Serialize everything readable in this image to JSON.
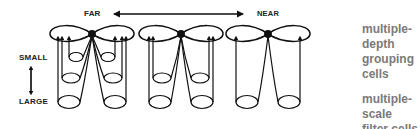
{
  "axis": {
    "depth": {
      "far_label": "FAR",
      "near_label": "NEAR"
    },
    "scale": {
      "small_label": "SMALL",
      "large_label": "LARGE"
    }
  },
  "labels": {
    "grouping": {
      "line1": "multiple-depth",
      "line2": "grouping cells"
    },
    "filter": {
      "line1": "multiple-scale",
      "line2": "filter cells"
    }
  },
  "figures": [
    {
      "name": "far",
      "scales_connected": 3
    },
    {
      "name": "middle",
      "scales_connected": 2
    },
    {
      "name": "near",
      "scales_connected": 1
    }
  ],
  "colors": {
    "line": "#111111",
    "side_text": "#7a7a7a"
  }
}
